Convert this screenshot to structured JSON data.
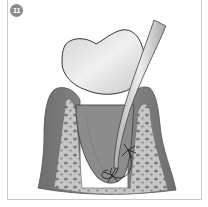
{
  "figure": {
    "step_number": "11",
    "illustration": "periodontal-scaler-in-pocket",
    "colors": {
      "badge": "#8a8a8a",
      "frame_border": "#c9c9c9",
      "enamel": "#e2e2e2",
      "root": "#8c8c8c",
      "gum": "#7a7a7a",
      "bone": "#c4c4c4",
      "bone_pores": "#7d7d7d",
      "instrument": "#d8d8d8"
    }
  }
}
